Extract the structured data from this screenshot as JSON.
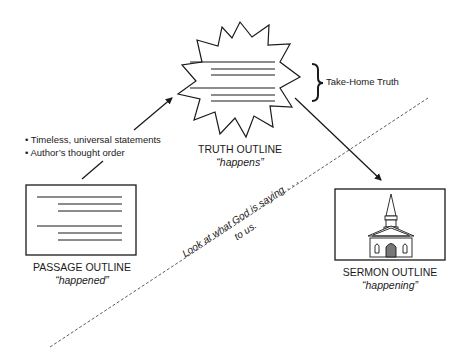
{
  "diagram": {
    "truth": {
      "title": "TRUTH OUTLINE",
      "subtitle": "“happens”"
    },
    "take_home": {
      "label": "Take-Home Truth"
    },
    "passage": {
      "title": "PASSAGE OUTLINE",
      "subtitle": "“happened”"
    },
    "sermon": {
      "title": "SERMON OUTLINE",
      "subtitle": "“happening”",
      "icon": "church-icon"
    },
    "bullets": [
      "• Timeless, universal statements",
      "• Author’s thought order"
    ],
    "divider_text": {
      "line1": "Look at what God is saying . . .",
      "line2": "to us."
    },
    "colors": {
      "ink": "#1a1a1a",
      "background": "#ffffff"
    }
  }
}
